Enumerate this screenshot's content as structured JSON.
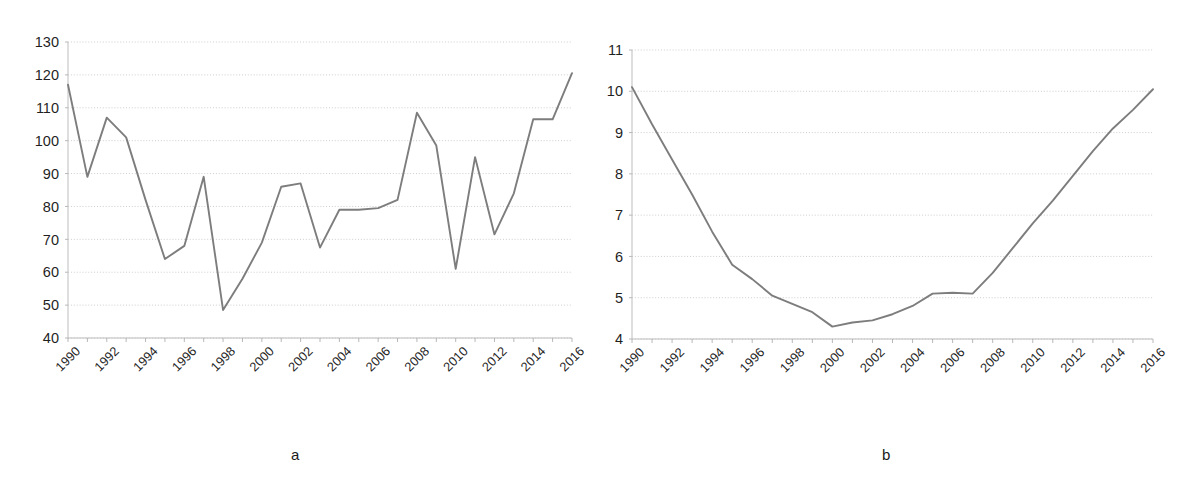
{
  "figure": {
    "panels": [
      {
        "id": "a",
        "caption": "a"
      },
      {
        "id": "b",
        "caption": "b"
      }
    ]
  },
  "chart_data": [
    {
      "type": "line",
      "panel": "a",
      "title": "",
      "subtitle": "",
      "xlabel": "",
      "ylabel": "",
      "xlim": [
        1990,
        2016
      ],
      "ylim": [
        40,
        130
      ],
      "ytick_step": 10,
      "xtick_step": 2,
      "grid": true,
      "grid_axis": "y",
      "legend": false,
      "legend_position": "none",
      "x_tick_labels": [
        "1990",
        "1992",
        "1994",
        "1996",
        "1998",
        "2000",
        "2002",
        "2004",
        "2006",
        "2008",
        "2010",
        "2012",
        "2014",
        "2016"
      ],
      "y_tick_labels": [
        "40",
        "50",
        "60",
        "70",
        "80",
        "90",
        "100",
        "110",
        "120",
        "130"
      ],
      "x": [
        1990,
        1991,
        1992,
        1993,
        1994,
        1995,
        1996,
        1997,
        1998,
        1999,
        2000,
        2001,
        2002,
        2003,
        2004,
        2005,
        2006,
        2007,
        2008,
        2009,
        2010,
        2011,
        2012,
        2013,
        2014,
        2015,
        2016
      ],
      "values": [
        117,
        89,
        107,
        101,
        82,
        64,
        68,
        89,
        48.5,
        58,
        69,
        86,
        87,
        67.5,
        79,
        79,
        79.5,
        82,
        108.5,
        98.5,
        61,
        95,
        71.5,
        84,
        106.5,
        106.5,
        120.5
      ],
      "series": [
        {
          "name": "series-a",
          "values": [
            117,
            89,
            107,
            101,
            82,
            64,
            68,
            89,
            48.5,
            58,
            69,
            86,
            87,
            67.5,
            79,
            79,
            79.5,
            82,
            108.5,
            98.5,
            61,
            95,
            71.5,
            84,
            106.5,
            106.5,
            120.5
          ]
        }
      ]
    },
    {
      "type": "line",
      "panel": "b",
      "title": "",
      "subtitle": "",
      "xlabel": "",
      "ylabel": "",
      "xlim": [
        1990,
        2016
      ],
      "ylim": [
        4,
        11
      ],
      "ytick_step": 1,
      "xtick_step": 2,
      "grid": true,
      "grid_axis": "y",
      "legend": false,
      "legend_position": "none",
      "x_tick_labels": [
        "1990",
        "1992",
        "1994",
        "1996",
        "1998",
        "2000",
        "2002",
        "2004",
        "2006",
        "2008",
        "2010",
        "2012",
        "2014",
        "2016"
      ],
      "y_tick_labels": [
        "4",
        "5",
        "6",
        "7",
        "8",
        "9",
        "10",
        "11"
      ],
      "x": [
        1990,
        1991,
        1992,
        1993,
        1994,
        1995,
        1996,
        1997,
        1998,
        1999,
        2000,
        2001,
        2002,
        2003,
        2004,
        2005,
        2006,
        2007,
        2008,
        2009,
        2010,
        2011,
        2012,
        2013,
        2014,
        2015,
        2016
      ],
      "values": [
        10.1,
        9.2,
        8.35,
        7.5,
        6.6,
        5.8,
        5.45,
        5.05,
        4.85,
        4.65,
        4.3,
        4.4,
        4.45,
        4.6,
        4.8,
        5.1,
        5.12,
        5.1,
        5.6,
        6.2,
        6.8,
        7.35,
        7.95,
        8.55,
        9.1,
        9.55,
        10.05
      ]
    }
  ],
  "style": {
    "line_color": "#7d7d7d",
    "grid_color": "#c8c8c8",
    "axis_color": "#bdbdbd",
    "text_color": "#1f1f1f",
    "background": "#ffffff"
  }
}
